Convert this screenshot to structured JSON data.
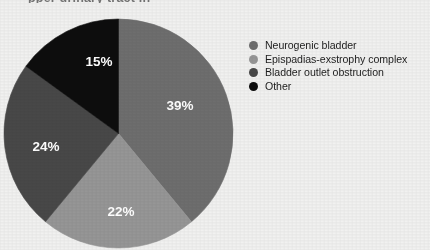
{
  "figure": {
    "title_cropped": "pper urinary tract in",
    "background_color": "#f1f1f0"
  },
  "chart_data": {
    "type": "pie",
    "title": "",
    "xlabel": "",
    "ylabel": "",
    "start_angle_deg": 0,
    "direction": "clockwise",
    "legend_position": "right",
    "grid": false,
    "categories": [
      "Neurogenic bladder",
      "Epispadias-exstrophy complex",
      "Bladder outlet obstruction",
      "Other"
    ],
    "values": [
      39,
      22,
      24,
      15
    ],
    "value_labels": [
      "39%",
      "22%",
      "24%",
      "15%"
    ],
    "colors": [
      "#6e6e6e",
      "#969696",
      "#484848",
      "#0d0d0d"
    ],
    "label_text_color": "#ffffff",
    "slices": [
      {
        "label": "Neurogenic bladder",
        "value": 39,
        "display": "39%",
        "color": "#6e6e6e",
        "label_x": 180,
        "label_y": 106
      },
      {
        "label": "Epispadias-exstrophy complex",
        "value": 22,
        "display": "22%",
        "color": "#969696",
        "label_x": 121,
        "label_y": 212
      },
      {
        "label": "Bladder outlet obstruction",
        "value": 24,
        "display": "24%",
        "color": "#484848",
        "label_x": 46,
        "label_y": 147
      },
      {
        "label": "Other",
        "value": 15,
        "display": "15%",
        "color": "#0d0d0d",
        "label_x": 99,
        "label_y": 62
      }
    ]
  },
  "legend": {
    "items": [
      {
        "label": "Neurogenic bladder",
        "color": "#6e6e6e"
      },
      {
        "label": "Epispadias-exstrophy complex",
        "color": "#969696"
      },
      {
        "label": "Bladder outlet obstruction",
        "color": "#484848"
      },
      {
        "label": "Other",
        "color": "#0d0d0d"
      }
    ]
  }
}
